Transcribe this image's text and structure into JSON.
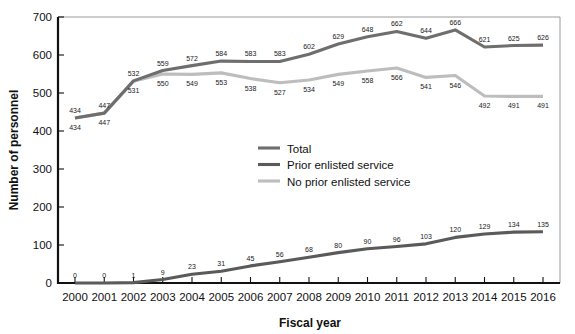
{
  "chart_data": {
    "type": "line",
    "title": "",
    "xlabel": "Fiscal year",
    "ylabel": "Number of personnel",
    "categories": [
      "2000",
      "2001",
      "2002",
      "2003",
      "2004",
      "2005",
      "2006",
      "2007",
      "2008",
      "2009",
      "2010",
      "2011",
      "2012",
      "2013",
      "2014",
      "2015",
      "2016"
    ],
    "xlim": [
      2000,
      2016
    ],
    "ylim": [
      0,
      700
    ],
    "y_ticks": [
      0,
      100,
      200,
      300,
      400,
      500,
      600,
      700
    ],
    "grid": false,
    "legend_position": "center",
    "series": [
      {
        "name": "Total",
        "color": "#6e6e6e",
        "values": [
          434,
          447,
          532,
          559,
          572,
          584,
          583,
          583,
          602,
          629,
          648,
          662,
          644,
          666,
          621,
          625,
          626
        ]
      },
      {
        "name": "Prior enlisted service",
        "color": "#5a5a5a",
        "values": [
          0,
          0,
          1,
          9,
          23,
          31,
          45,
          56,
          68,
          80,
          90,
          96,
          103,
          120,
          129,
          134,
          135
        ]
      },
      {
        "name": "No prior enlisted service",
        "color": "#bdbdbd",
        "values": [
          434,
          447,
          531,
          550,
          549,
          553,
          538,
          527,
          534,
          549,
          558,
          566,
          541,
          546,
          492,
          491,
          491
        ]
      }
    ]
  },
  "axes": {
    "y_title": "Number of personnel",
    "x_title": "Fiscal year",
    "y_tick_labels": [
      "0",
      "100",
      "200",
      "300",
      "400",
      "500",
      "600",
      "700"
    ],
    "x_tick_labels": [
      "2000",
      "2001",
      "2002",
      "2003",
      "2004",
      "2005",
      "2006",
      "2007",
      "2008",
      "2009",
      "2010",
      "2011",
      "2012",
      "2013",
      "2014",
      "2015",
      "2016"
    ]
  },
  "legend": {
    "items": [
      {
        "label": "Total",
        "color": "#6e6e6e"
      },
      {
        "label": "Prior enlisted service",
        "color": "#5a5a5a"
      },
      {
        "label": "No prior enlisted service",
        "color": "#bdbdbd"
      }
    ]
  },
  "colors": {
    "axis": "#111111",
    "frame": "#9a9a9a",
    "background": "#ffffff",
    "label_text": "#1a1a1a"
  }
}
